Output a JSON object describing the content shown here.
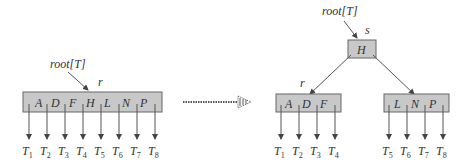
{
  "before": {
    "root_label": "root[T]",
    "node_label": "r",
    "keys": [
      "A",
      "D",
      "F",
      "H",
      "L",
      "N",
      "P"
    ],
    "subtrees": [
      "1",
      "2",
      "3",
      "4",
      "5",
      "6",
      "7",
      "8"
    ]
  },
  "arrow": {
    "style": "dotted-transform-arrow"
  },
  "after": {
    "root_label": "root[T]",
    "root_node_label": "s",
    "root_keys": [
      "H"
    ],
    "left_node_label": "r",
    "left_keys": [
      "A",
      "D",
      "F"
    ],
    "left_subtrees": [
      "1",
      "2",
      "3",
      "4"
    ],
    "right_keys": [
      "L",
      "N",
      "P"
    ],
    "right_subtrees": [
      "5",
      "6",
      "7",
      "8"
    ]
  },
  "subtree_prefix": "T",
  "colors": {
    "node_fill": "#c8c8c8",
    "node_stroke": "#666666",
    "line": "#555555"
  }
}
